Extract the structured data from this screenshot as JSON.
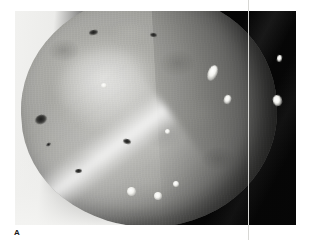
{
  "figure": {
    "panel_label": "A",
    "caption_text": "",
    "image_type": "grayscale-photograph",
    "background_description": "black background at right, white surface at left",
    "width_px": 313,
    "height_px": 240
  },
  "photo": {
    "frame": {
      "left": 15,
      "top": 11,
      "width": 281,
      "height": 214
    },
    "colors": {
      "background_dark": "#060606",
      "background_light": "#f2f2f0",
      "tuber_mid": "#a9a9a4",
      "tuber_light": "#b9b9b4",
      "tuber_shadow": "#3d3d3b",
      "highlight": "#ffffff",
      "lesion_dark": "#1d1d1c",
      "seam_line": "#d7d7d4",
      "label_text": "#1a1a1a"
    },
    "tuber": {
      "shape": "oval",
      "rotation_deg": -3,
      "left": 6,
      "top": -16,
      "width": 256,
      "height": 232
    },
    "marks": [
      {
        "name": "dark-lesion-left",
        "kind": "dark",
        "left": 20,
        "top": 104,
        "width": 12,
        "height": 9,
        "rotate": -22
      },
      {
        "name": "dark-lesion-upper-left",
        "kind": "dark",
        "left": 74,
        "top": 19,
        "width": 9,
        "height": 5,
        "rotate": -10
      },
      {
        "name": "dark-lesion-upper-mid",
        "kind": "dark",
        "left": 135,
        "top": 22,
        "width": 7,
        "height": 4,
        "rotate": 8
      },
      {
        "name": "dark-lesion-mid",
        "kind": "dark",
        "left": 108,
        "top": 128,
        "width": 8,
        "height": 5,
        "rotate": 14
      },
      {
        "name": "dark-lesion-lower-left",
        "kind": "dark",
        "left": 60,
        "top": 158,
        "width": 7,
        "height": 4,
        "rotate": -6
      },
      {
        "name": "dark-fleck-left-rim",
        "kind": "dark",
        "left": 31,
        "top": 132,
        "width": 5,
        "height": 3,
        "rotate": -30
      },
      {
        "name": "white-spot-upper-right",
        "kind": "white",
        "left": 193,
        "top": 54,
        "width": 9,
        "height": 16,
        "rotate": 22
      },
      {
        "name": "white-spot-mid-right",
        "kind": "white",
        "left": 209,
        "top": 84,
        "width": 7,
        "height": 9,
        "rotate": 18
      },
      {
        "name": "white-spot-far-right",
        "kind": "white",
        "left": 258,
        "top": 84,
        "width": 9,
        "height": 11,
        "rotate": -14
      },
      {
        "name": "white-spot-right-edge",
        "kind": "white",
        "left": 262,
        "top": 44,
        "width": 5,
        "height": 7,
        "rotate": 10
      },
      {
        "name": "white-spot-lower-a",
        "kind": "white",
        "left": 112,
        "top": 176,
        "width": 9,
        "height": 9,
        "rotate": 0
      },
      {
        "name": "white-spot-lower-b",
        "kind": "white",
        "left": 139,
        "top": 181,
        "width": 8,
        "height": 8,
        "rotate": 0
      },
      {
        "name": "white-spot-lower-c",
        "kind": "white",
        "left": 158,
        "top": 170,
        "width": 6,
        "height": 6,
        "rotate": 0
      },
      {
        "name": "white-fleck-center",
        "kind": "white",
        "left": 150,
        "top": 118,
        "width": 5,
        "height": 5,
        "rotate": 0
      },
      {
        "name": "white-fleck-upper",
        "kind": "white",
        "left": 86,
        "top": 72,
        "width": 6,
        "height": 5,
        "rotate": 0
      }
    ],
    "overlay": {
      "seam_line_x": 248,
      "seam_line_visible": true
    }
  }
}
